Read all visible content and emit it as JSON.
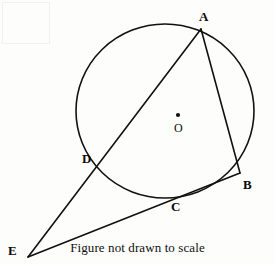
{
  "figure": {
    "caption": "Figure not drawn to scale",
    "stroke_color": "#111111",
    "background_color": "#fdfdfb",
    "circle": {
      "center_label": "O",
      "center_dot": {
        "x": 178,
        "y": 115
      },
      "cx": 165,
      "cy": 111,
      "rx": 89,
      "ry": 87
    },
    "points": [
      {
        "name": "A",
        "label": "A",
        "x": 201,
        "y": 29,
        "label_x": 199,
        "label_y": 10
      },
      {
        "name": "B",
        "label": "B",
        "x": 240,
        "y": 173,
        "label_x": 243,
        "label_y": 178
      },
      {
        "name": "C",
        "label": "C",
        "x": 175,
        "y": 197,
        "label_x": 171,
        "label_y": 200
      },
      {
        "name": "D",
        "label": "D",
        "x": 97,
        "y": 161,
        "label_x": 82,
        "label_y": 152
      },
      {
        "name": "E",
        "label": "E",
        "x": 28,
        "y": 257,
        "label_x": 8,
        "label_y": 244
      }
    ],
    "segments": [
      {
        "name": "segment-A-B",
        "from": "A",
        "to": "B"
      },
      {
        "name": "segment-A-D-E",
        "from": "A",
        "to": "E"
      },
      {
        "name": "segment-B-C-E",
        "from": "B",
        "to": "E"
      }
    ]
  }
}
